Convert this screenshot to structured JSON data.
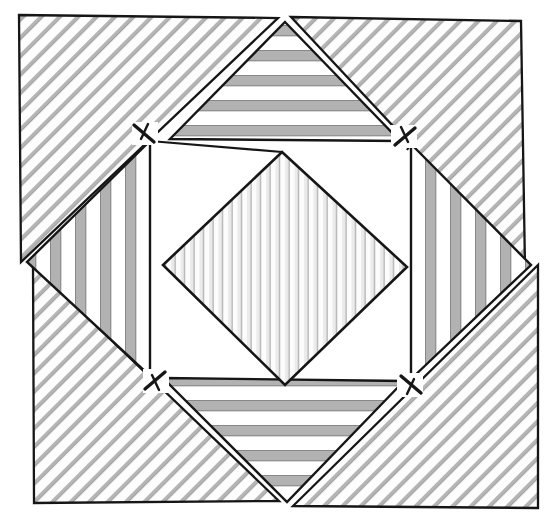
{
  "figure": {
    "type": "geometric-dissection-diagram",
    "canvas": {
      "width": 549,
      "height": 524,
      "background": "#ffffff"
    },
    "outline": {
      "name": "tilted-square",
      "rotation_deg": 1.6,
      "corners": [
        {
          "label": "top-left",
          "x": 19,
          "y": 15
        },
        {
          "label": "top-right",
          "x": 521,
          "y": 21
        },
        {
          "label": "bottom-right",
          "x": 538,
          "y": 508
        },
        {
          "label": "bottom-left",
          "x": 34,
          "y": 503
        }
      ],
      "stroke": "#161616",
      "stroke_width": 2.2
    },
    "palette": {
      "ink": "#161616",
      "paper": "#ffffff",
      "hatch_light": "#b9b9b9",
      "hatch_mid": "#8d8d8d",
      "band_gray": "#b0b0b0",
      "band_dark": "#9a9a9a",
      "band_pale": "#e2e2e2"
    },
    "pieces": [
      {
        "id": "corner-nw",
        "name": "corner-triangle-northwest",
        "fill": "diagonal-hatch-45",
        "tone": "light",
        "orientation": "diagonal"
      },
      {
        "id": "corner-ne",
        "name": "corner-triangle-northeast",
        "fill": "diagonal-hatch-45",
        "tone": "light",
        "orientation": "diagonal"
      },
      {
        "id": "corner-sw",
        "name": "corner-triangle-southwest",
        "fill": "diagonal-hatch-45",
        "tone": "light",
        "orientation": "diagonal"
      },
      {
        "id": "corner-se",
        "name": "corner-triangle-southeast",
        "fill": "diagonal-hatch-45",
        "tone": "light",
        "orientation": "diagonal"
      },
      {
        "id": "edge-n",
        "name": "edge-triangle-north",
        "fill": "horizontal-bands",
        "tone": "mid",
        "orientation": "horizontal"
      },
      {
        "id": "edge-s",
        "name": "edge-triangle-south",
        "fill": "horizontal-bands",
        "tone": "mid",
        "orientation": "horizontal"
      },
      {
        "id": "edge-w",
        "name": "edge-triangle-west",
        "fill": "vertical-bands",
        "tone": "mid",
        "orientation": "vertical"
      },
      {
        "id": "edge-e",
        "name": "edge-triangle-east",
        "fill": "vertical-bands",
        "tone": "mid",
        "orientation": "vertical"
      },
      {
        "id": "core",
        "name": "central-diamond",
        "fill": "fine-vertical-stripes",
        "tone": "pale",
        "orientation": "vertical"
      }
    ],
    "tick_marks": [
      {
        "id": "tick-nw",
        "name": "junction-tick-northwest",
        "x": 145,
        "y": 133,
        "angle_deg": 45
      },
      {
        "id": "tick-ne",
        "name": "junction-tick-northeast",
        "x": 404,
        "y": 136,
        "angle_deg": -45
      },
      {
        "id": "tick-sw",
        "name": "junction-tick-southwest",
        "x": 156,
        "y": 381,
        "angle_deg": -45
      },
      {
        "id": "tick-se",
        "name": "junction-tick-southeast",
        "x": 410,
        "y": 385,
        "angle_deg": 45
      }
    ],
    "caption": ""
  }
}
